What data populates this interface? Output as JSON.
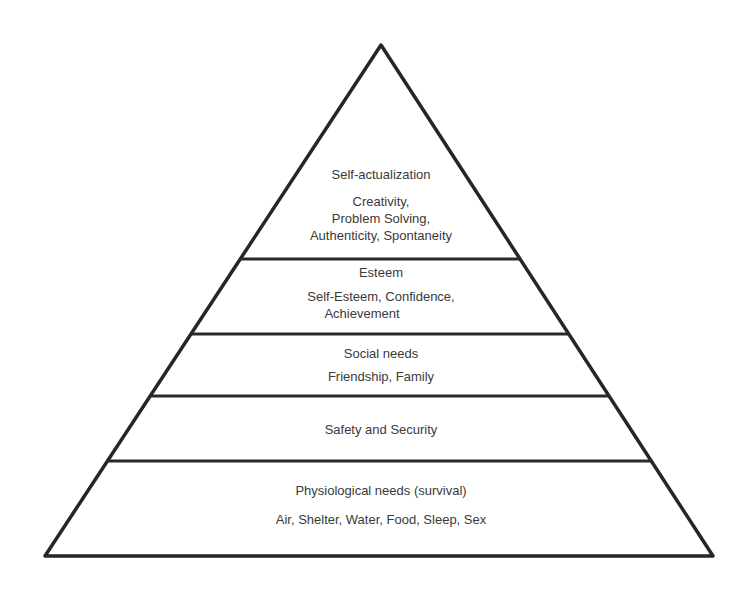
{
  "diagram": {
    "type": "pyramid",
    "levels_top_to_bottom": [
      {
        "title": "Self-actualization",
        "details": [
          "Creativity,",
          "Problem Solving,",
          "Authenticity, Spontaneity"
        ]
      },
      {
        "title": "Esteem",
        "details": [
          "Self-Esteem, Confidence,",
          "Achievement"
        ]
      },
      {
        "title": "Social needs",
        "details": [
          "Friendship, Family"
        ]
      },
      {
        "title": "Safety and Security",
        "details": []
      },
      {
        "title": "Physiological needs (survival)",
        "details": [
          "Air, Shelter, Water, Food, Sleep, Sex"
        ]
      }
    ]
  },
  "colors": {
    "stroke": "#262626",
    "text": "#3a3a3a",
    "background": "#ffffff"
  }
}
